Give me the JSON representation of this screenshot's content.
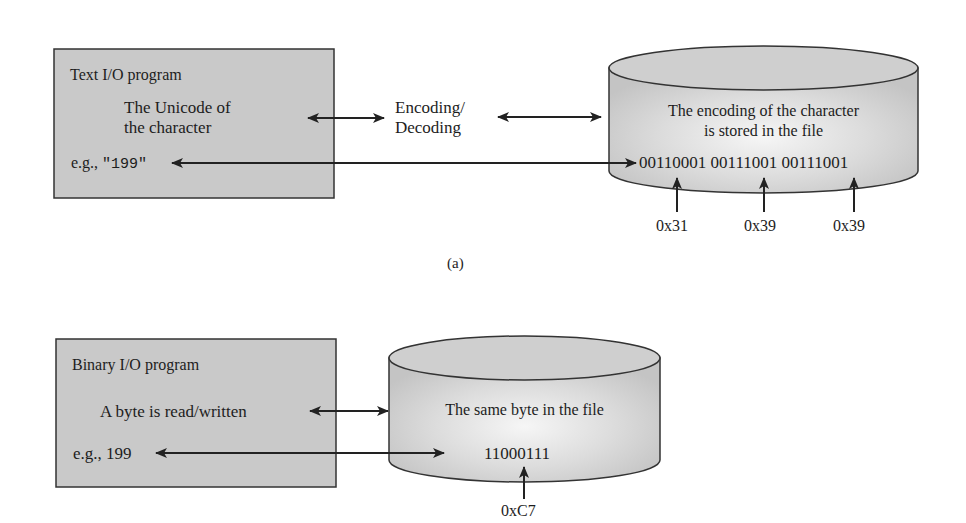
{
  "colors": {
    "box_fill": "#c9c9c9",
    "cylinder_fill": "#d6d6d6",
    "cylinder_highlight": "#f4f4f4",
    "stroke": "#222222",
    "text": "#1d1d1d"
  },
  "diagram_a": {
    "caption": "(a)",
    "program_box": {
      "title": "Text I/O program",
      "line1": "The Unicode of",
      "line2": "the character",
      "example_prefix": "e.g., ",
      "example_value": "\"199\""
    },
    "middle_label": {
      "line1": "Encoding/",
      "line2": "Decoding"
    },
    "file_cylinder": {
      "line1": "The encoding of the character",
      "line2": "is stored in the file",
      "bits": "00110001 00111001 00111001"
    },
    "hex_labels": [
      "0x31",
      "0x39",
      "0x39"
    ]
  },
  "diagram_b": {
    "program_box": {
      "title": "Binary I/O program",
      "line1": "A byte is read/written",
      "example": "e.g., 199"
    },
    "file_cylinder": {
      "line1": "The same byte in the file",
      "bits": "11000111"
    },
    "hex_labels": [
      "0xC7"
    ]
  }
}
